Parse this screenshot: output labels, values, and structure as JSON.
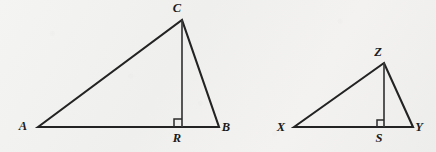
{
  "figure": {
    "background_color": "#f1f1ef",
    "stroke_color": "#232323",
    "label_color": "#1b1b1b"
  },
  "triangles": [
    {
      "name": "triangle-abc",
      "vertices": {
        "A": {
          "label": "A",
          "x": 38,
          "y": 127,
          "label_x": 23,
          "label_y": 130
        },
        "B": {
          "label": "B",
          "x": 219,
          "y": 127,
          "label_x": 226,
          "label_y": 131
        },
        "C": {
          "label": "C",
          "x": 182,
          "y": 20,
          "label_x": 177,
          "label_y": 12
        }
      },
      "foot": {
        "label": "R",
        "x": 182,
        "y": 127,
        "label_x": 177,
        "label_y": 142
      },
      "sides_path": "M 38 127 L 182 20 L 219 127 Z",
      "altitude_path": "M 182 20 L 182 127",
      "right_angle_path": "M 174 127 L 174 119 L 182 119"
    },
    {
      "name": "triangle-xyz",
      "vertices": {
        "X": {
          "label": "X",
          "x": 294,
          "y": 127,
          "label_x": 281,
          "label_y": 131
        },
        "Y": {
          "label": "Y",
          "x": 413,
          "y": 127,
          "label_x": 419,
          "label_y": 131
        },
        "Z": {
          "label": "Z",
          "x": 384,
          "y": 63,
          "label_x": 378,
          "label_y": 56
        }
      },
      "foot": {
        "label": "S",
        "x": 384,
        "y": 127,
        "label_x": 379,
        "label_y": 142
      },
      "sides_path": "M 294 127 L 384 63 L 413 127 Z",
      "altitude_path": "M 384 63 L 384 127",
      "right_angle_path": "M 377 127 L 377 120 L 384 120"
    }
  ]
}
